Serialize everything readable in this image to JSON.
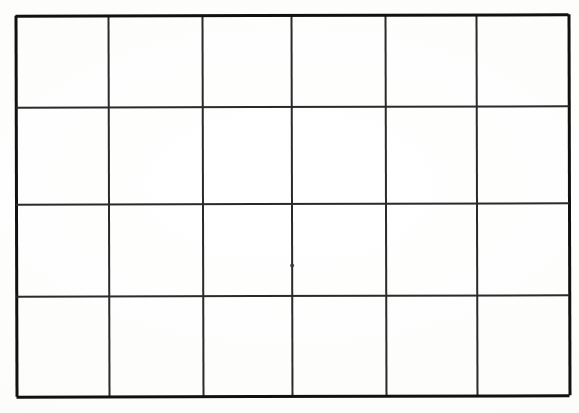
{
  "document": {
    "title": "Empty Grid Table",
    "description": "Hand-drawn blank table grid on paper",
    "background_color": "#fdfdfc",
    "ink_color": "#1b1b1b",
    "canvas": {
      "width": 579,
      "height": 413
    }
  },
  "grid": {
    "columns": 6,
    "rows": 4,
    "cell_count": 24,
    "border_color": "#111111",
    "inner_line_color": "#2a2a2a",
    "outer_stroke_width": 3,
    "inner_stroke_width": 2,
    "bounds": {
      "left": 16,
      "top": 15,
      "right": 569,
      "bottom": 396
    },
    "vertical_line_x": [
      16,
      109,
      203,
      292,
      386,
      477,
      569
    ],
    "horizontal_line_y": [
      15,
      107,
      204,
      296,
      396
    ],
    "column_widths": [
      93,
      94,
      89,
      94,
      91,
      92
    ],
    "row_heights": [
      92,
      97,
      92,
      100
    ],
    "cells": [
      {
        "row": 0,
        "col": 0,
        "value": ""
      },
      {
        "row": 0,
        "col": 1,
        "value": ""
      },
      {
        "row": 0,
        "col": 2,
        "value": ""
      },
      {
        "row": 0,
        "col": 3,
        "value": ""
      },
      {
        "row": 0,
        "col": 4,
        "value": ""
      },
      {
        "row": 0,
        "col": 5,
        "value": ""
      },
      {
        "row": 1,
        "col": 0,
        "value": ""
      },
      {
        "row": 1,
        "col": 1,
        "value": ""
      },
      {
        "row": 1,
        "col": 2,
        "value": ""
      },
      {
        "row": 1,
        "col": 3,
        "value": ""
      },
      {
        "row": 1,
        "col": 4,
        "value": ""
      },
      {
        "row": 1,
        "col": 5,
        "value": ""
      },
      {
        "row": 2,
        "col": 0,
        "value": ""
      },
      {
        "row": 2,
        "col": 1,
        "value": ""
      },
      {
        "row": 2,
        "col": 2,
        "value": ""
      },
      {
        "row": 2,
        "col": 3,
        "value": ""
      },
      {
        "row": 2,
        "col": 4,
        "value": ""
      },
      {
        "row": 2,
        "col": 5,
        "value": ""
      },
      {
        "row": 3,
        "col": 0,
        "value": ""
      },
      {
        "row": 3,
        "col": 1,
        "value": ""
      },
      {
        "row": 3,
        "col": 2,
        "value": ""
      },
      {
        "row": 3,
        "col": 3,
        "value": ""
      },
      {
        "row": 3,
        "col": 4,
        "value": ""
      },
      {
        "row": 3,
        "col": 5,
        "value": ""
      }
    ]
  },
  "artifacts": [
    {
      "name": "ink-speck",
      "x": 290,
      "y": 264,
      "width": 4,
      "height": 3,
      "color": "#3a3a3a"
    }
  ]
}
